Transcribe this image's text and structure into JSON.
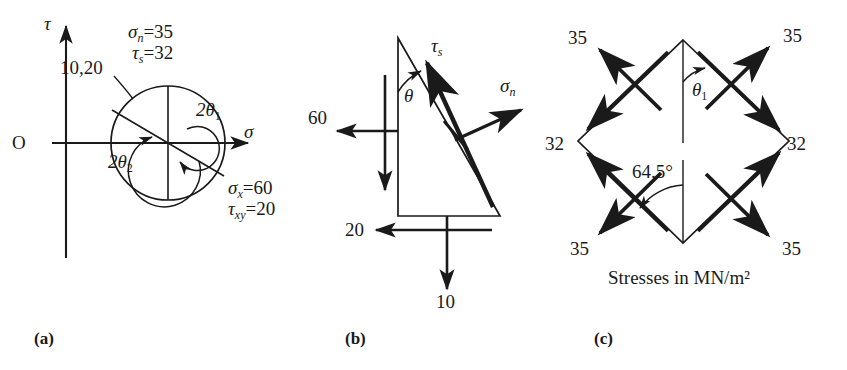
{
  "figure": {
    "caption_units": "Stresses in MN/m²",
    "panels": [
      {
        "tag": "(a)",
        "name": "mohr-circle"
      },
      {
        "tag": "(b)",
        "name": "wedge-element"
      },
      {
        "tag": "(c)",
        "name": "principal-element"
      }
    ]
  },
  "panel_a": {
    "axis_tau": "τ",
    "axis_sigma": "σ",
    "origin": "O",
    "point_label": "10,20",
    "top_label_sigma_n": "σ",
    "top_label_sigma_n_sub": "n",
    "top_label_sigma_n_val": "=35",
    "top_label_tau_s": "τ",
    "top_label_tau_s_sub": "s",
    "top_label_tau_s_val": "=32",
    "right_label_sigma_x": "σ",
    "right_label_sigma_x_sub": "x",
    "right_label_sigma_x_val": "=60",
    "right_label_tau_xy": "τ",
    "right_label_tau_xy_sub": "xy",
    "right_label_tau_xy_val": "=20",
    "angle_1": "2θ",
    "angle_1_sub": "1",
    "angle_2": "2θ",
    "angle_2_sub": "2",
    "circle": {
      "cx": 168,
      "cy": 143,
      "r": 57
    },
    "inner_arc_1_r": 36,
    "inner_arc_2_r": 22
  },
  "panel_b": {
    "stress_left": "60",
    "stress_bottom_horizontal": "20",
    "stress_bottom_vertical": "10",
    "theta": "θ",
    "tau_s": "τ",
    "tau_s_sub": "s",
    "sigma_n": "σ",
    "sigma_n_sub": "n",
    "triangle": {
      "apex_x": 398,
      "apex_y": 38,
      "bl_x": 398,
      "bl_y": 216,
      "br_x": 500,
      "br_y": 216
    }
  },
  "panel_c": {
    "normal_stress": "35",
    "shear_stress": "32",
    "theta_1": "θ",
    "theta_1_sub": "1",
    "angle_value": "64.5°",
    "corner_labels": {
      "top_left": "35",
      "top_right": "35",
      "left": "32",
      "right": "32",
      "bottom_left": "35",
      "bottom_right": "35"
    },
    "diamond": {
      "top_x": 683,
      "top_y": 40,
      "right_x": 789,
      "right_y": 141,
      "bottom_x": 683,
      "bottom_y": 243,
      "left_x": 578,
      "left_y": 141
    }
  },
  "colors": {
    "ink": "#1a1a1a",
    "background": "#ffffff"
  }
}
